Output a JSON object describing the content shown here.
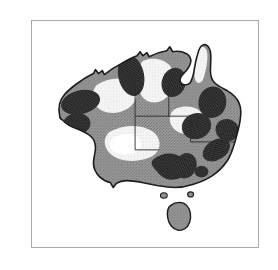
{
  "document": {
    "type": "scanned-book-page-figure",
    "page_background": "#ffffff",
    "ink_color": "#2a2a2a"
  },
  "edge_column_text": {
    "description": "right-hand sliver of a neighbouring text column, glyphs clipped by the page crop",
    "glyphs": [
      {
        "char": "e",
        "top": 40
      },
      {
        "char": "e",
        "top": 66
      },
      {
        "char": "t",
        "top": 92
      },
      {
        "char": "n",
        "top": 118
      },
      {
        "char": "l",
        "top": 144
      },
      {
        "char": "e",
        "top": 176
      },
      {
        "char": ",",
        "top": 202
      },
      {
        "char": "o",
        "top": 224
      }
    ]
  },
  "figure": {
    "name": "australia-distribution-map",
    "frame": {
      "x": 31,
      "y": 20,
      "width": 228,
      "height": 228,
      "border_color": "#a9a9a9",
      "border_width": 1.5,
      "fill": "#ffffff"
    },
    "caption": "",
    "map": {
      "title": "",
      "region": "Australia",
      "projection_note": "",
      "outline_color": "#1c1c1c",
      "outline_width": 1.6,
      "shading_classes": [
        {
          "name": "high",
          "label": "",
          "fill": "#2f2f2f",
          "description": "dark stippled patches"
        },
        {
          "name": "medium",
          "label": "",
          "fill": "#8e8e8e",
          "description": "mid-grey stippled background"
        },
        {
          "name": "low",
          "label": "",
          "fill": "#f2f2f2",
          "description": "light / unshaded areas"
        }
      ],
      "internal_borders": {
        "color": "#2a2a2a",
        "width": 0.9,
        "description": "state and territory boundary lines"
      },
      "features": {
        "mainland": "Australian continent",
        "tasmania": "Tasmania",
        "cape_york": "Cape York Peninsula",
        "islands": "small offshore islets in Bass Strait"
      },
      "dark_patch_count": 11,
      "light_patch_count": 6
    }
  }
}
